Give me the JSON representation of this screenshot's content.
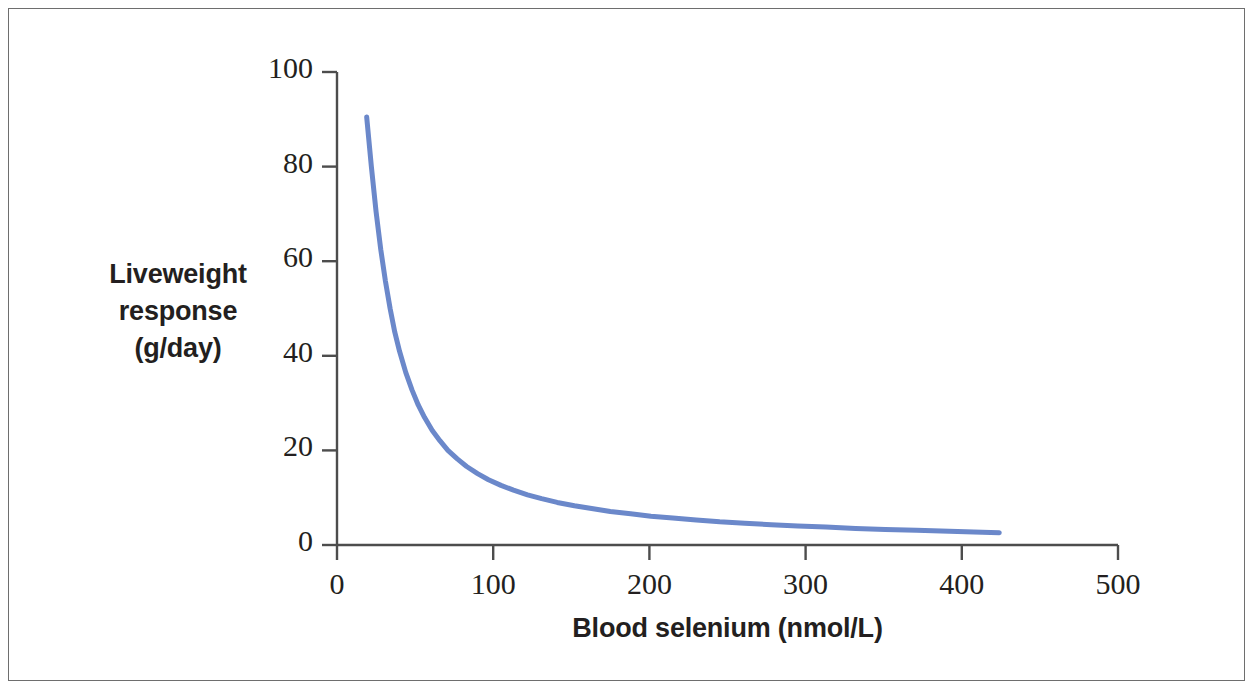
{
  "figure": {
    "border_color": "#6e6e6e",
    "background": "#ffffff"
  },
  "chart_data": {
    "type": "line",
    "title": "",
    "subtitle": "",
    "xlabel": "Blood selenium (nmol/L)",
    "ylabel": "Liveweight response (g/day)",
    "ylabel_lines": [
      "Liveweight",
      "response",
      "(g/day)"
    ],
    "xlim": [
      0,
      500
    ],
    "ylim": [
      0,
      100
    ],
    "xticks": [
      0,
      100,
      200,
      300,
      400,
      500
    ],
    "yticks": [
      0,
      20,
      40,
      60,
      80,
      100
    ],
    "xtick_labels": [
      "0",
      "100",
      "200",
      "300",
      "400",
      "500"
    ],
    "ytick_labels": [
      "0",
      "20",
      "40",
      "60",
      "80",
      "100"
    ],
    "grid": false,
    "legend": null,
    "legend_position": "none",
    "series": [
      {
        "name": "Liveweight response",
        "color": "#6b88ca",
        "line_width": 5,
        "markers": false,
        "x": [
          19,
          22,
          25,
          28,
          31,
          34,
          37,
          40,
          44,
          48,
          52,
          56,
          61,
          66,
          71,
          77,
          83,
          90,
          97,
          105,
          113,
          122,
          131,
          141,
          152,
          163,
          175,
          188,
          201,
          215,
          230,
          245,
          261,
          278,
          295,
          313,
          332,
          351,
          371,
          392,
          413,
          424
        ],
        "y": [
          90.5,
          80.0,
          70.5,
          62.5,
          55.8,
          50.0,
          45.0,
          41.0,
          36.5,
          32.8,
          29.6,
          27.0,
          24.2,
          22.0,
          20.0,
          18.2,
          16.6,
          15.1,
          13.8,
          12.6,
          11.6,
          10.6,
          9.8,
          9.0,
          8.3,
          7.7,
          7.1,
          6.6,
          6.1,
          5.7,
          5.3,
          4.9,
          4.6,
          4.3,
          4.0,
          3.8,
          3.5,
          3.3,
          3.1,
          2.9,
          2.7,
          2.6
        ]
      }
    ],
    "annotations": []
  },
  "axes": {
    "x_title": "Blood selenium (nmol/L)",
    "y_title_line1": "Liveweight",
    "y_title_line2": "response",
    "y_title_line3": "(g/day)",
    "x_labels": [
      "0",
      "100",
      "200",
      "300",
      "400",
      "500"
    ],
    "y_labels": [
      "100",
      "80",
      "60",
      "40",
      "20",
      "0"
    ],
    "axis_color": "#4d4d4d"
  }
}
